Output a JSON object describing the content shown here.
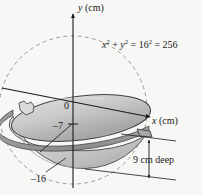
{
  "figure": {
    "axes": {
      "y_axis_label": "y (cm)",
      "y_axis_var": "y",
      "y_axis_unit": "(cm)",
      "x_axis_label": "x (cm)",
      "x_axis_var": "x",
      "x_axis_unit": "(cm)"
    },
    "tick_labels": {
      "origin": "0",
      "bowl_rim_level": "–7",
      "bowl_bottom": "–16"
    },
    "equation": {
      "full": "x² + y² = 16² = 256",
      "lhs_term1_base": "x",
      "lhs_term1_exp": "2",
      "operator_plus": "+",
      "lhs_term2_base": "y",
      "lhs_term2_exp": "2",
      "operator_equals_1": "=",
      "rhs_base": "16",
      "rhs_exp": "2",
      "operator_equals_2": "=",
      "result": "256"
    },
    "annotations": {
      "depth": "9 cm deep"
    },
    "colors": {
      "background": "#f7f7f5",
      "bowl_interior_top": "#d2d2d2",
      "bowl_interior_bottom": "#a9a9a9",
      "bowl_exterior": "#cfcfcf",
      "bowl_exterior_shadow": "#b6b6b6",
      "rim_band": "#8e8e8e",
      "outline": "#3a3a3a",
      "axis": "#1a1a1a",
      "dashed_circle": "#9a9a9a",
      "text": "#1a1a1a"
    },
    "geometry": {
      "origin_px": [
        73,
        110
      ],
      "circle_radius_px": 74,
      "rim_ellipse_rx": 74,
      "rim_ellipse_ry": 22,
      "rim_tilt_deg": -7,
      "depth_arrow_top_px": [
        149,
        143
      ],
      "depth_arrow_bottom_px": [
        149,
        176
      ]
    }
  }
}
